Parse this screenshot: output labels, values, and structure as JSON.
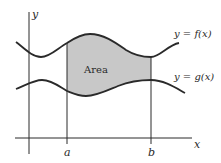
{
  "diagram": {
    "type": "area-between-curves",
    "axes": {
      "x_label": "x",
      "y_label": "y"
    },
    "bounds": {
      "a_label": "a",
      "b_label": "b"
    },
    "curves": {
      "upper_label": "y = f(x)",
      "lower_label": "y = g(x)"
    },
    "region": {
      "label": "Area",
      "fill_color": "#c8c8c8"
    },
    "colors": {
      "stroke": "#2a2a2a",
      "background": "#ffffff"
    }
  }
}
